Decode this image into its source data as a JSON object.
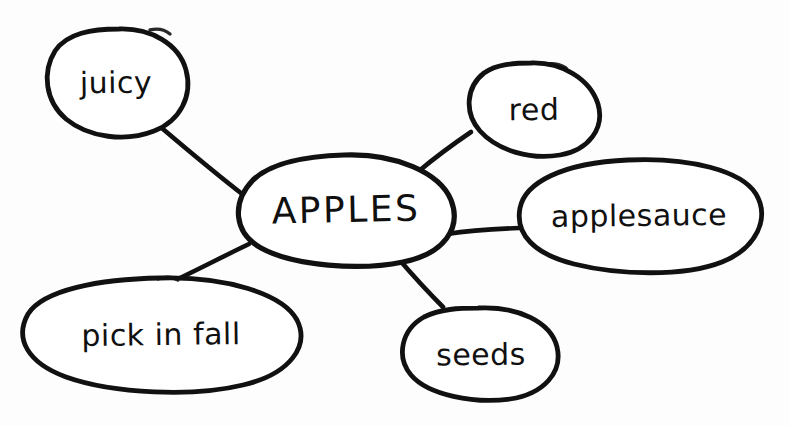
{
  "diagram": {
    "type": "concept-map",
    "background_color": "#fdfdfd",
    "ink_color": "#111111",
    "style": "hand-drawn marker on white paper",
    "central_node": {
      "id": "apples",
      "label": "APPLES",
      "shape": "ellipse",
      "cx": 346,
      "cy": 209,
      "rx": 106,
      "ry": 54,
      "font_size": 36,
      "uppercase": true
    },
    "nodes": [
      {
        "id": "juicy",
        "label": "juicy",
        "shape": "ellipse",
        "cx": 116,
        "cy": 82,
        "rx": 71,
        "ry": 53,
        "font_size": 30
      },
      {
        "id": "red",
        "label": "red",
        "shape": "ellipse",
        "cx": 534,
        "cy": 109,
        "rx": 65,
        "ry": 47,
        "font_size": 30
      },
      {
        "id": "applesauce",
        "label": "applesauce",
        "shape": "ellipse",
        "cx": 639,
        "cy": 215,
        "rx": 121,
        "ry": 55,
        "font_size": 30
      },
      {
        "id": "pick-in-fall",
        "label": "pick in fall",
        "shape": "ellipse",
        "cx": 161,
        "cy": 334,
        "rx": 139,
        "ry": 56,
        "font_size": 30
      },
      {
        "id": "seeds",
        "label": "seeds",
        "shape": "ellipse",
        "cx": 481,
        "cy": 354,
        "rx": 77,
        "ry": 46,
        "font_size": 30
      }
    ],
    "edges": [
      {
        "id": "edge-juicy",
        "from": "juicy",
        "to": "apples"
      },
      {
        "id": "edge-red",
        "from": "red",
        "to": "apples"
      },
      {
        "id": "edge-applesauce",
        "from": "applesauce",
        "to": "apples"
      },
      {
        "id": "edge-pick-in-fall",
        "from": "pick-in-fall",
        "to": "apples"
      },
      {
        "id": "edge-seeds",
        "from": "seeds",
        "to": "apples"
      }
    ]
  }
}
